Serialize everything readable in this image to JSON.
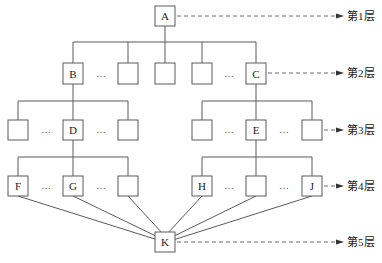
{
  "diagram": {
    "type": "hierarchy",
    "nodes": [
      {
        "id": "A",
        "label": "A",
        "level": 1
      },
      {
        "id": "B",
        "label": "B",
        "level": 2
      },
      {
        "id": "L2_2",
        "label": "",
        "level": 2
      },
      {
        "id": "L2_3",
        "label": "",
        "level": 2
      },
      {
        "id": "L2_4",
        "label": "",
        "level": 2
      },
      {
        "id": "C",
        "label": "C",
        "level": 2
      },
      {
        "id": "L3_1",
        "label": "",
        "level": 3
      },
      {
        "id": "D",
        "label": "D",
        "level": 3
      },
      {
        "id": "L3_3",
        "label": "",
        "level": 3
      },
      {
        "id": "L3_4",
        "label": "",
        "level": 3
      },
      {
        "id": "E",
        "label": "E",
        "level": 3
      },
      {
        "id": "L3_6",
        "label": "",
        "level": 3
      },
      {
        "id": "F",
        "label": "F",
        "level": 4
      },
      {
        "id": "G",
        "label": "G",
        "level": 4
      },
      {
        "id": "L4_3",
        "label": "",
        "level": 4
      },
      {
        "id": "H",
        "label": "H",
        "level": 4
      },
      {
        "id": "L4_5",
        "label": "",
        "level": 4
      },
      {
        "id": "J",
        "label": "J",
        "level": 4
      },
      {
        "id": "K",
        "label": "K",
        "level": 5
      }
    ],
    "ellipsis": "…",
    "levels": [
      {
        "label": "第1层"
      },
      {
        "label": "第2层"
      },
      {
        "label": "第3层"
      },
      {
        "label": "第4层"
      },
      {
        "label": "第5层"
      }
    ]
  }
}
